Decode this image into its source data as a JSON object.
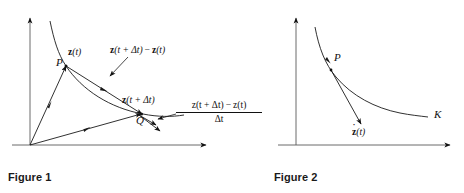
{
  "page": {
    "background_color": "#ffffff",
    "ink_color": "#111111",
    "width": 464,
    "height": 193
  },
  "figures": [
    {
      "id": "figure-1",
      "caption": "Figure 1",
      "axes": {
        "origin_label": "",
        "x_axis_name": "x-axis",
        "y_axis_name": "y-axis"
      },
      "points": [
        {
          "name": "P",
          "label": "P"
        },
        {
          "name": "Q",
          "label": "Q"
        }
      ],
      "labels": {
        "z_t": {
          "vector": "z",
          "arg": "(t)"
        },
        "z_t_plus": {
          "vector": "z",
          "arg": "(t + Δt)"
        },
        "difference": {
          "lead_vector": "z",
          "lead_arg": "(t + Δt)",
          "operator": "−",
          "tail_vector": "z",
          "tail_arg": "(t)"
        },
        "quotient": {
          "numerator_lead_vector": "z",
          "numerator_lead_arg": "(t + Δt)",
          "numerator_operator": "−",
          "numerator_tail_vector": "z",
          "numerator_tail_arg": "(t)",
          "denominator": "Δt"
        }
      }
    },
    {
      "id": "figure-2",
      "caption": "Figure 2",
      "axes": {
        "x_axis_name": "x-axis",
        "y_axis_name": "y-axis"
      },
      "points": [
        {
          "name": "P",
          "label": "P"
        }
      ],
      "labels": {
        "curve_name": "K",
        "derivative": {
          "vector": "z",
          "dot": "˙",
          "arg": "(t)"
        }
      }
    }
  ]
}
